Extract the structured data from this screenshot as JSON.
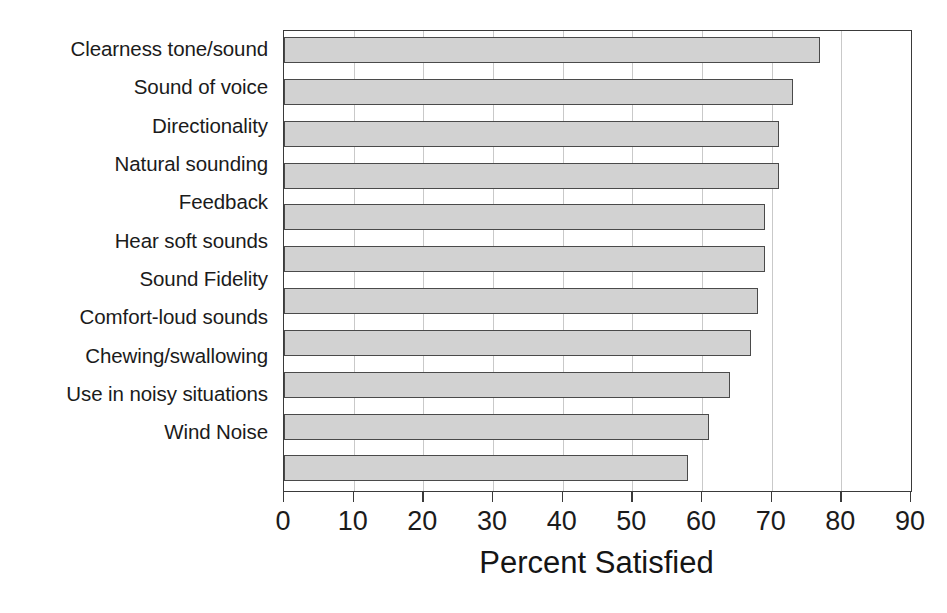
{
  "chart_data": {
    "type": "bar",
    "orientation": "horizontal",
    "title": "",
    "xlabel": "Percent Satisfied",
    "ylabel": "",
    "xlim": [
      0,
      90
    ],
    "xticks": [
      0,
      10,
      20,
      30,
      40,
      50,
      60,
      70,
      80,
      90
    ],
    "grid": true,
    "legend": false,
    "bar_color": "#d2d2d2",
    "bar_edge_color": "#4a4a4a",
    "categories": [
      "Clearness tone/sound",
      "Sound of voice",
      "Directionality",
      "Natural sounding",
      "Feedback",
      "Hear soft sounds",
      "Sound Fidelity",
      "Comfort-loud sounds",
      "Chewing/swallowing",
      "Use in noisy situations",
      "Wind Noise"
    ],
    "values": [
      77,
      73,
      71,
      71,
      69,
      69,
      68,
      67,
      64,
      61,
      58
    ]
  },
  "caption": {
    "text": ""
  }
}
